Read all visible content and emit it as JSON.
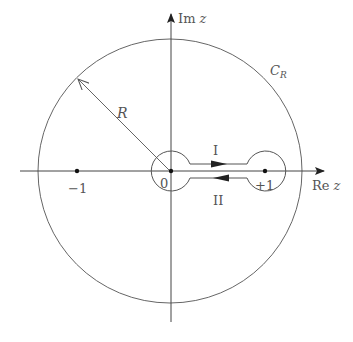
{
  "diagram": {
    "axes": {
      "imag_label_prefix": "Im",
      "imag_label_var": "z",
      "real_label_prefix": "Re",
      "real_label_var": "z"
    },
    "points": [
      {
        "label": "−1",
        "value": -1
      },
      {
        "label": "0",
        "value": 0
      },
      {
        "label": "+1",
        "value": 1
      }
    ],
    "outer_circle": {
      "label_main": "C",
      "label_sub": "R"
    },
    "radius_label": "R",
    "paths": [
      {
        "label": "I",
        "direction": "right"
      },
      {
        "label": "II",
        "direction": "left"
      }
    ],
    "colors": {
      "stroke": "#555555",
      "axis": "#444444",
      "point": "#111111"
    }
  }
}
